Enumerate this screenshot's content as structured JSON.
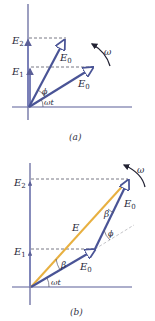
{
  "colors": {
    "axis": "#5b5f97",
    "phasor": "#4a5496",
    "resultant": "#e8b040",
    "dashed": "#555566",
    "text": "#2a2a3a",
    "background": "#ffffff"
  },
  "panel_a": {
    "caption": "(a)",
    "labels": {
      "E2": "E",
      "E2_sub": "2",
      "E1": "E",
      "E1_sub": "1",
      "E0_upper": "E",
      "E0_upper_sub": "0",
      "E0_lower": "E",
      "E0_lower_sub": "0",
      "phi": "ϕ",
      "omega_t": "ωt",
      "omega": "ω"
    }
  },
  "panel_b": {
    "caption": "(b)",
    "labels": {
      "E2": "E",
      "E2_sub": "2",
      "E1": "E",
      "E1_sub": "1",
      "E": "E",
      "E0_upper": "E",
      "E0_upper_sub": "0",
      "E0_lower": "E",
      "E0_lower_sub": "0",
      "beta_upper": "β",
      "beta_lower": "β",
      "phi": "ϕ",
      "omega_t": "ωt",
      "omega": "ω"
    }
  }
}
